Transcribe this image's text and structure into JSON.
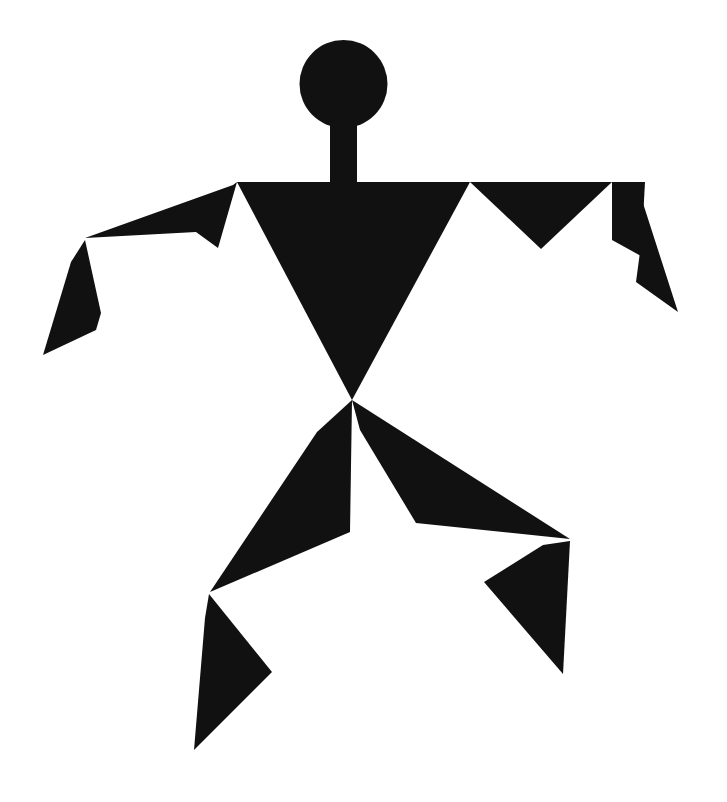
{
  "artwork": {
    "title": "Angular Human Figure Pictogram",
    "subject": "running-dancing-person",
    "style": "flat-geometric-silhouette",
    "background_color": "#ffffff",
    "figure_color": "#111111",
    "canvas": {
      "width": 727,
      "height": 802
    }
  },
  "shapes": {
    "head": {
      "name": "head",
      "type": "circle",
      "cx": 343.5,
      "cy": 84,
      "r": 44
    },
    "neck": {
      "name": "neck",
      "type": "rect",
      "x": 330,
      "y": 122,
      "width": 27,
      "height": 62
    },
    "torso": {
      "name": "torso",
      "type": "polygon",
      "points": "237,182 470,182 352,400"
    },
    "left_upper_arm": {
      "name": "left-upper-arm",
      "type": "polygon",
      "points": "237,182 233,185 85,238 196,232 218,248"
    },
    "left_forearm_hand": {
      "name": "left-forearm-hand",
      "type": "polygon",
      "points": "85,240 101,313 96,330 43,355 71,262"
    },
    "right_upper_arm_inner": {
      "name": "right-upper-arm-inner",
      "type": "polygon",
      "points": "470,182 612,182 541,249"
    },
    "right_upper_arm_outer": {
      "name": "right-upper-arm-outer",
      "type": "polygon",
      "points": "612,182 645,182 641,256 612,240"
    },
    "right_forearm_hand": {
      "name": "right-forearm-hand",
      "type": "polygon",
      "points": "641,197 678,312 636,282 640,252"
    },
    "left_thigh": {
      "name": "left-thigh",
      "type": "polygon",
      "points": "352,400 350,532 210,592 317,432"
    },
    "left_shin_foot": {
      "name": "left-shin-foot",
      "type": "polygon",
      "points": "209,594 272,672 194,750 205,618"
    },
    "right_thigh": {
      "name": "right-thigh",
      "type": "polygon",
      "points": "352,400 570,539 416,523 360,430"
    },
    "right_shin_foot": {
      "name": "right-shin-foot",
      "type": "polygon",
      "points": "570,541 563,674 484,582 543,545"
    }
  },
  "shape_order": [
    "head",
    "neck",
    "torso",
    "left_upper_arm",
    "left_forearm_hand",
    "right_upper_arm_inner",
    "right_upper_arm_outer",
    "right_forearm_hand",
    "left_thigh",
    "left_shin_foot",
    "right_thigh",
    "right_shin_foot"
  ]
}
